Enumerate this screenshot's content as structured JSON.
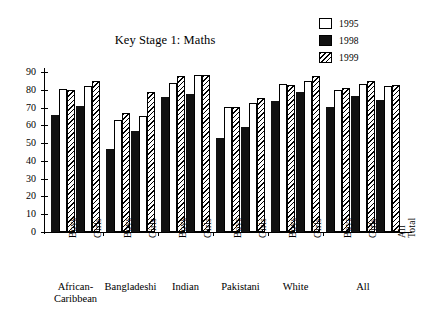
{
  "chart_data": {
    "type": "bar",
    "title": "Key Stage 1: Maths",
    "xlabel": "",
    "ylabel": "",
    "ylim": [
      0,
      90
    ],
    "yticks": [
      0,
      10,
      20,
      30,
      40,
      50,
      60,
      70,
      80,
      90
    ],
    "grid": false,
    "legend_position": "top-right",
    "categories": [
      "Boys",
      "Girls",
      "Boys",
      "Girls",
      "Boys",
      "Girls",
      "Boys",
      "Girls",
      "Boys",
      "Girls",
      "Boys",
      "Girls",
      "All Total"
    ],
    "groups": [
      {
        "name": "African-Caribbean",
        "label_lines": [
          "African-",
          "Caribbean"
        ],
        "categories": [
          "Boys",
          "Girls"
        ]
      },
      {
        "name": "Bangladeshi",
        "label_lines": [
          "Bangladeshi"
        ],
        "categories": [
          "Boys",
          "Girls"
        ]
      },
      {
        "name": "Indian",
        "label_lines": [
          "Indian"
        ],
        "categories": [
          "Boys",
          "Girls"
        ]
      },
      {
        "name": "Pakistani",
        "label_lines": [
          "Pakistani"
        ],
        "categories": [
          "Boys",
          "Girls"
        ]
      },
      {
        "name": "White",
        "label_lines": [
          "White"
        ],
        "categories": [
          "Boys",
          "Girls"
        ]
      },
      {
        "name": "All",
        "label_lines": [
          "All"
        ],
        "categories": [
          "Boys",
          "Girls",
          "All Total"
        ]
      }
    ],
    "series": [
      {
        "name": "1995",
        "fill": "white",
        "values": [
          80.5,
          82,
          63,
          65.5,
          84,
          88.5,
          70.5,
          72.5,
          83,
          85,
          80,
          83.5,
          82
        ]
      },
      {
        "name": "1998",
        "fill": "solid-black",
        "values": [
          66,
          71,
          46.5,
          57,
          76,
          77.5,
          53,
          59,
          73.5,
          78.5,
          70.5,
          76.5,
          74
        ]
      },
      {
        "name": "1999",
        "fill": "diagonal-hatch",
        "values": [
          80,
          85,
          67,
          78.5,
          87.5,
          88.5,
          70.5,
          75.5,
          82.5,
          88,
          81,
          85,
          82.5
        ]
      }
    ]
  },
  "legend": {
    "items": [
      {
        "label": "1995",
        "swatch": "white-square"
      },
      {
        "label": "1998",
        "swatch": "black-square"
      },
      {
        "label": "1999",
        "swatch": "hatched-square"
      }
    ]
  },
  "axis": {
    "y_tick_labels": [
      "90",
      "80",
      "70",
      "60",
      "50",
      "40",
      "30",
      "20",
      "10",
      "0"
    ]
  }
}
